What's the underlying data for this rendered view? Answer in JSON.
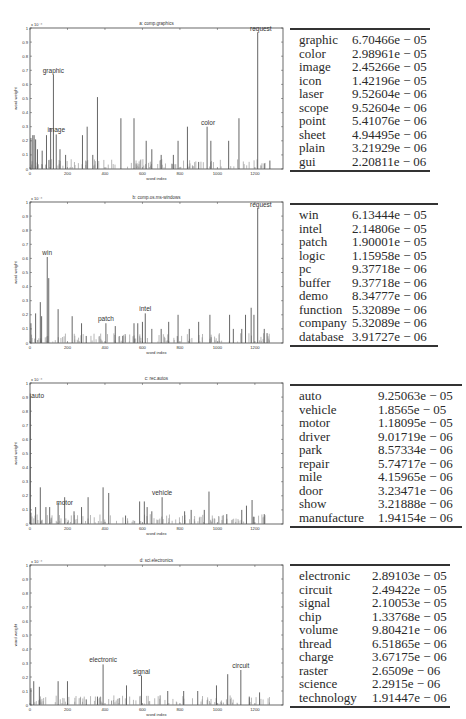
{
  "chart_data": [
    {
      "type": "bar",
      "panel": "a",
      "title": "a:    comp.graphics",
      "xlabel": "word index",
      "ylabel": "word weight",
      "y_scale_note": "x 10^-4",
      "xlim": [
        0,
        1350
      ],
      "ylim": [
        0,
        1
      ],
      "xticks": [
        "0",
        "200",
        "400",
        "600",
        "800",
        "1000",
        "1200"
      ],
      "yticks": [
        "0",
        "0.1",
        "0.2",
        "0.3",
        "0.4",
        "0.5",
        "0.6",
        "0.7",
        "0.8",
        "0.9",
        "1"
      ],
      "annotations": [
        {
          "text": "request",
          "x": 1215,
          "y": 0.97
        },
        {
          "text": "graphic",
          "x": 125,
          "y": 0.67
        },
        {
          "text": "image",
          "x": 140,
          "y": 0.245
        },
        {
          "text": "color",
          "x": 950,
          "y": 0.3
        }
      ],
      "bars": {
        "x": [
          5,
          15,
          22,
          30,
          40,
          65,
          88,
          110,
          125,
          140,
          160,
          190,
          280,
          305,
          335,
          360,
          485,
          555,
          620,
          650,
          700,
          765,
          790,
          840,
          900,
          945,
          965,
          1060,
          1115,
          1215,
          1250,
          1280
        ],
        "values": [
          0.22,
          0.24,
          0.24,
          0.21,
          0.14,
          0.13,
          0.24,
          0.29,
          0.67,
          0.245,
          0.14,
          0.1,
          0.24,
          0.3,
          0.1,
          0.51,
          0.36,
          0.36,
          0.2,
          0.14,
          0.1,
          0.1,
          0.2,
          0.3,
          0.05,
          0.3,
          0.2,
          0.2,
          0.36,
          0.97,
          0.04,
          0.06
        ]
      },
      "table": {
        "columns": [
          "word",
          "weight"
        ],
        "rows": [
          [
            "graphic",
            "6.70466e − 05"
          ],
          [
            "color",
            "2.98961e − 05"
          ],
          [
            "image",
            "2.45266e − 05"
          ],
          [
            "icon",
            "1.42196e − 05"
          ],
          [
            "laser",
            "9.52604e − 06"
          ],
          [
            "scope",
            "9.52604e − 06"
          ],
          [
            "point",
            "5.41076e − 06"
          ],
          [
            "sheet",
            "4.94495e − 06"
          ],
          [
            "plain",
            "3.21929e − 06"
          ],
          [
            "gui",
            "2.20811e − 06"
          ]
        ]
      }
    },
    {
      "type": "bar",
      "panel": "b",
      "title": "b:    comp.os.ms-windows",
      "xlabel": "word index",
      "ylabel": "word weight",
      "y_scale_note": "x 10^-4",
      "xlim": [
        0,
        1350
      ],
      "ylim": [
        0,
        1
      ],
      "xticks": [
        "0",
        "200",
        "400",
        "600",
        "800",
        "1000",
        "1200"
      ],
      "yticks": [
        "0",
        "0.1",
        "0.2",
        "0.3",
        "0.4",
        "0.5",
        "0.6",
        "0.7",
        "0.8",
        "0.9",
        "1"
      ],
      "annotations": [
        {
          "text": "request",
          "x": 1215,
          "y": 0.96
        },
        {
          "text": "win",
          "x": 92,
          "y": 0.61
        },
        {
          "text": "patch",
          "x": 405,
          "y": 0.14
        },
        {
          "text": "intel",
          "x": 615,
          "y": 0.21
        }
      ],
      "bars": {
        "x": [
          5,
          30,
          55,
          62,
          92,
          100,
          150,
          225,
          275,
          300,
          405,
          455,
          495,
          555,
          575,
          600,
          615,
          650,
          700,
          740,
          790,
          850,
          900,
          960,
          1065,
          1085,
          1130,
          1150,
          1180,
          1195,
          1215,
          1250,
          1265
        ],
        "values": [
          0.14,
          0.21,
          0.29,
          0.19,
          0.61,
          0.46,
          0.24,
          0.19,
          0.14,
          0.05,
          0.14,
          0.12,
          0.05,
          0.14,
          0.14,
          0.15,
          0.21,
          0.1,
          0.1,
          0.15,
          0.2,
          0.1,
          0.15,
          0.2,
          0.2,
          0.1,
          0.1,
          0.2,
          0.25,
          0.2,
          0.96,
          0.1,
          0.07
        ]
      },
      "table": {
        "columns": [
          "word",
          "weight"
        ],
        "rows": [
          [
            "win",
            "6.13444e − 05"
          ],
          [
            "intel",
            "2.14806e − 05"
          ],
          [
            "patch",
            "1.90001e − 05"
          ],
          [
            "logic",
            "1.15958e − 05"
          ],
          [
            "pc",
            "9.37718e − 06"
          ],
          [
            "buffer",
            "9.37718e − 06"
          ],
          [
            "demo",
            "8.34777e − 06"
          ],
          [
            "function",
            "5.32089e − 06"
          ],
          [
            "company",
            "5.32089e − 06"
          ],
          [
            "database",
            "3.91727e − 06"
          ]
        ]
      }
    },
    {
      "type": "bar",
      "panel": "c",
      "title": "c:    rec.autos",
      "xlabel": "word index",
      "ylabel": "word weight",
      "y_scale_note": "x 10^-4",
      "xlim": [
        0,
        1350
      ],
      "ylim": [
        0,
        1
      ],
      "xticks": [
        "0",
        "200",
        "400",
        "600",
        "800",
        "1000",
        "1200"
      ],
      "yticks": [
        "0",
        "0.1",
        "0.2",
        "0.3",
        "0.4",
        "0.5",
        "0.6",
        "0.7",
        "0.8",
        "0.9",
        "1"
      ],
      "annotations": [
        {
          "text": "auto",
          "x": 2,
          "y": 0.925
        },
        {
          "text": "motor",
          "x": 185,
          "y": 0.12
        },
        {
          "text": "vehicle",
          "x": 705,
          "y": 0.19
        }
      ],
      "bars": {
        "x": [
          2,
          5,
          30,
          55,
          85,
          105,
          150,
          185,
          235,
          275,
          310,
          390,
          420,
          510,
          585,
          610,
          625,
          650,
          705,
          825,
          860,
          930,
          955,
          1050,
          1130,
          1155,
          1185,
          1195,
          1250
        ],
        "values": [
          0.925,
          0.08,
          0.12,
          0.26,
          0.12,
          0.12,
          0.15,
          0.19,
          0.09,
          0.12,
          0.19,
          0.26,
          0.22,
          0.06,
          0.16,
          0.16,
          0.12,
          0.09,
          0.19,
          0.09,
          0.1,
          0.1,
          0.23,
          0.07,
          0.1,
          0.13,
          0.17,
          0.05,
          0.07
        ]
      },
      "table": {
        "columns": [
          "word",
          "weight"
        ],
        "rows": [
          [
            "auto",
            "9.25063e − 05"
          ],
          [
            "vehicle",
            "1.8565e − 05"
          ],
          [
            "motor",
            "1.18095e − 05"
          ],
          [
            "driver",
            "9.01719e − 06"
          ],
          [
            "park",
            "8.57334e − 06"
          ],
          [
            "repair",
            "5.74717e − 06"
          ],
          [
            "mile",
            "4.15965e − 06"
          ],
          [
            "door",
            "3.23471e − 06"
          ],
          [
            "show",
            "3.21888e − 06"
          ],
          [
            "manufacture",
            "1.94154e − 06"
          ]
        ]
      }
    },
    {
      "type": "bar",
      "panel": "d",
      "title": "d:    sci.electronics",
      "xlabel": "word index",
      "ylabel": "word weight",
      "y_scale_note": "x 10^-4",
      "xlim": [
        0,
        1350
      ],
      "ylim": [
        0,
        1
      ],
      "xticks": [
        "0",
        "200",
        "400",
        "600",
        "800",
        "1000",
        "1200"
      ],
      "yticks": [
        "0",
        "0.1",
        "0.2",
        "0.3",
        "0.4",
        "0.5",
        "0.6",
        "0.7",
        "0.8",
        "0.9",
        "1"
      ],
      "annotations": [
        {
          "text": "electronic",
          "x": 390,
          "y": 0.29
        },
        {
          "text": "signal",
          "x": 595,
          "y": 0.21
        },
        {
          "text": "circuit",
          "x": 1125,
          "y": 0.25
        }
      ],
      "bars": {
        "x": [
          5,
          20,
          50,
          150,
          200,
          300,
          360,
          390,
          515,
          595,
          735,
          820,
          895,
          995,
          1055,
          1125,
          1170,
          1225
        ],
        "values": [
          0.12,
          0.17,
          0.13,
          0.17,
          0.17,
          0.04,
          0.06,
          0.29,
          0.14,
          0.21,
          0.1,
          0.1,
          0.1,
          0.14,
          0.22,
          0.25,
          0.06,
          0.09
        ]
      },
      "table": {
        "columns": [
          "word",
          "weight"
        ],
        "rows": [
          [
            "electronic",
            "2.89103e − 05"
          ],
          [
            "circuit",
            "2.49422e − 05"
          ],
          [
            "signal",
            "2.10053e − 05"
          ],
          [
            "chip",
            "1.33768e − 05"
          ],
          [
            "volume",
            "9.80421e − 06"
          ],
          [
            "thread",
            "6.51865e − 06"
          ],
          [
            "charge",
            "3.67175e − 06"
          ],
          [
            "raster",
            "2.6509e − 06"
          ],
          [
            "science",
            "2.2915e − 06"
          ],
          [
            "technology",
            "1.91447e − 06"
          ]
        ]
      }
    }
  ],
  "colors": {
    "bar": "#555555",
    "axis": "#444444",
    "rule": "#333333",
    "text": "#2a2a2a"
  }
}
